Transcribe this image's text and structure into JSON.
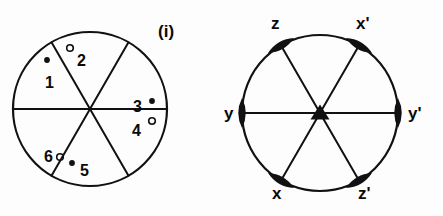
{
  "figure": {
    "title": "",
    "background_color": "#fdfdfd",
    "ink_color": "#111111",
    "panels": [
      {
        "tag": "(i)",
        "description": "circle divided into six sectors by three diameters, each sector bearing a numbered site marker",
        "circle": {
          "cx": 90,
          "cy": 109,
          "r": 77
        },
        "diameters_deg": [
          0,
          60,
          120
        ],
        "sites": [
          {
            "id": "1",
            "marker": "filled-dot",
            "label": "1",
            "label_x": 45,
            "label_y": 74,
            "dot_x": 47,
            "dot_y": 60
          },
          {
            "id": "2",
            "marker": "open-circle",
            "label": "2",
            "label_x": 77,
            "label_y": 52,
            "dot_x": 70,
            "dot_y": 48
          },
          {
            "id": "3",
            "marker": "filled-dot",
            "label": "3",
            "label_x": 133,
            "label_y": 98,
            "dot_x": 152,
            "dot_y": 101
          },
          {
            "id": "4",
            "marker": "open-circle",
            "label": "4",
            "label_x": 132,
            "label_y": 122,
            "dot_x": 152,
            "dot_y": 121
          },
          {
            "id": "5",
            "marker": "filled-dot",
            "label": "5",
            "label_x": 80,
            "label_y": 162,
            "dot_x": 72,
            "dot_y": 163
          },
          {
            "id": "6",
            "marker": "open-circle",
            "label": "6",
            "label_x": 44,
            "label_y": 148,
            "dot_x": 60,
            "dot_y": 157
          }
        ]
      },
      {
        "tag": "(ii)",
        "description": "circle with three diameters; filled lens-shaped markers at each of six rim intersections and a filled triangle at the centre",
        "circle": {
          "cx": 320,
          "cy": 113,
          "r": 78
        },
        "diameters_deg": [
          0,
          60,
          120
        ],
        "center_marker": "filled-triangle",
        "rim_markers": [
          {
            "label": "z",
            "angle_deg": 120,
            "label_x": 271,
            "label_y": 14
          },
          {
            "label": "x'",
            "angle_deg": 60,
            "label_x": 356,
            "label_y": 14
          },
          {
            "label": "y'",
            "angle_deg": 0,
            "label_x": 408,
            "label_y": 104
          },
          {
            "label": "z'",
            "angle_deg": 300,
            "label_x": 358,
            "label_y": 184
          },
          {
            "label": "x",
            "angle_deg": 240,
            "label_x": 272,
            "label_y": 184
          },
          {
            "label": "y",
            "angle_deg": 180,
            "label_x": 224,
            "label_y": 104
          }
        ]
      }
    ]
  }
}
